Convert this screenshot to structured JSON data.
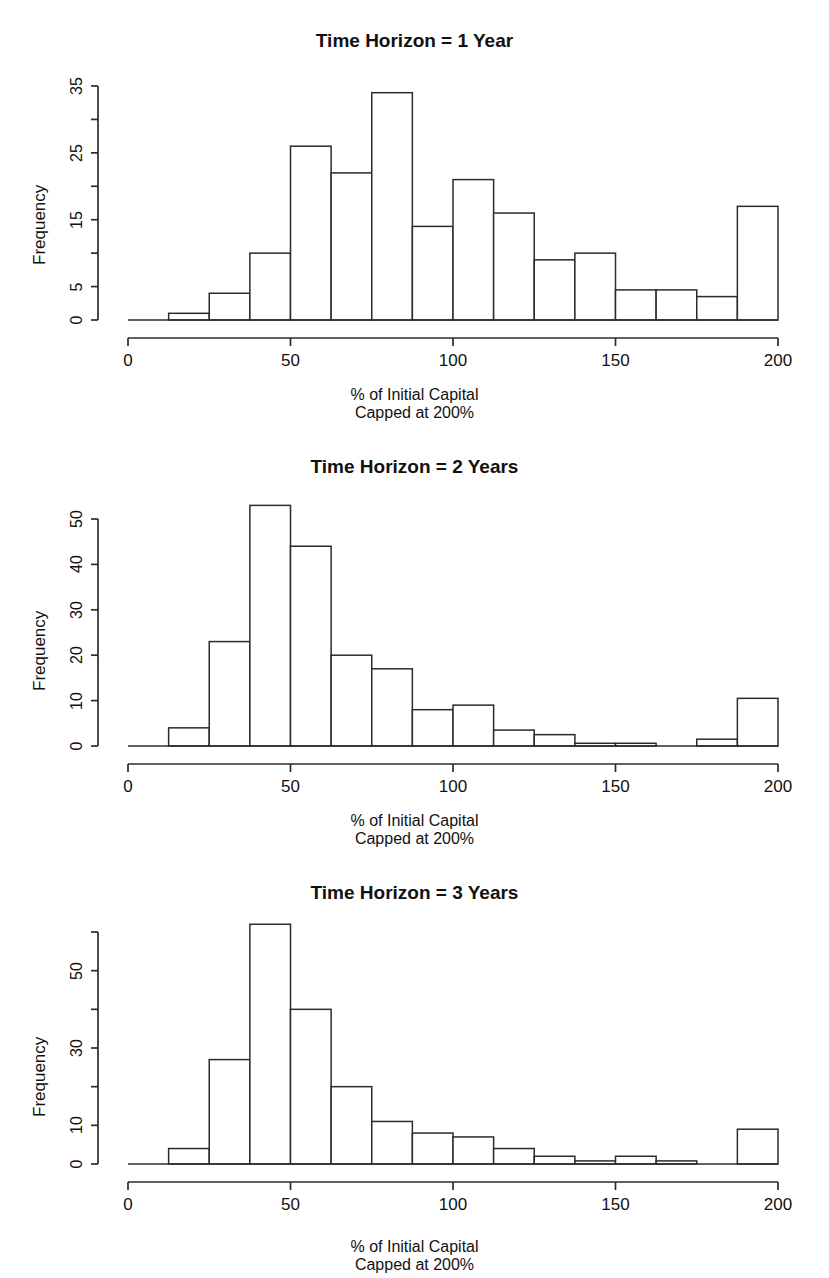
{
  "figure": {
    "background": "#ffffff",
    "axis_color": "#2b2b2b",
    "bar_fill": "#ffffff",
    "bar_stroke": "#2b2b2b",
    "panel_count": 3
  },
  "panels": [
    {
      "title": "Time Horizon = 1 Year",
      "ylabel": "Frequency",
      "xlabel_line1": "% of Initial Capital",
      "xlabel_line2": "Capped at 200%",
      "ytick_labels": [
        "0",
        "5",
        "15",
        "25",
        "35"
      ],
      "ytick_values": [
        0,
        5,
        15,
        25,
        35
      ],
      "yminor_values": [
        10,
        20,
        30
      ],
      "xtick_labels": [
        "0",
        "50",
        "100",
        "150",
        "200"
      ],
      "xtick_values": [
        0,
        50,
        100,
        150,
        200
      ]
    },
    {
      "title": "Time Horizon = 2 Years",
      "ylabel": "Frequency",
      "xlabel_line1": "% of Initial Capital",
      "xlabel_line2": "Capped at 200%",
      "ytick_labels": [
        "0",
        "10",
        "20",
        "30",
        "40",
        "50"
      ],
      "ytick_values": [
        0,
        10,
        20,
        30,
        40,
        50
      ],
      "yminor_values": [],
      "xtick_labels": [
        "0",
        "50",
        "100",
        "150",
        "200"
      ],
      "xtick_values": [
        0,
        50,
        100,
        150,
        200
      ]
    },
    {
      "title": "Time Horizon = 3 Years",
      "ylabel": "Frequency",
      "xlabel_line1": "% of Initial Capital",
      "xlabel_line2": "Capped at 200%",
      "ytick_labels": [
        "0",
        "10",
        "30",
        "50"
      ],
      "ytick_values": [
        0,
        10,
        30,
        50
      ],
      "yminor_values": [
        20,
        40,
        60
      ],
      "xtick_labels": [
        "0",
        "50",
        "100",
        "150",
        "200"
      ],
      "xtick_values": [
        0,
        50,
        100,
        150,
        200
      ]
    }
  ],
  "chart_data": [
    {
      "type": "bar",
      "title": "Time Horizon = 1 Year",
      "xlabel": "% of Initial Capital Capped at 200%",
      "ylabel": "Frequency",
      "bin_width": 12.5,
      "bin_edges": [
        0,
        12.5,
        25,
        37.5,
        50,
        62.5,
        75,
        87.5,
        100,
        112.5,
        125,
        137.5,
        150,
        162.5,
        175,
        187.5,
        200
      ],
      "categories": [
        "0-12.5",
        "12.5-25",
        "25-37.5",
        "37.5-50",
        "50-62.5",
        "62.5-75",
        "75-87.5",
        "87.5-100",
        "100-112.5",
        "112.5-125",
        "125-137.5",
        "137.5-150",
        "150-162.5",
        "162.5-175",
        "175-187.5",
        "187.5-200"
      ],
      "values": [
        0,
        1,
        4,
        10,
        26,
        22,
        34,
        14,
        21,
        16,
        9,
        10,
        4.5,
        4.5,
        3.5,
        17
      ],
      "xlim": [
        0,
        200
      ],
      "ylim": [
        0,
        35
      ],
      "grid": false,
      "legend": false
    },
    {
      "type": "bar",
      "title": "Time Horizon = 2 Years",
      "xlabel": "% of Initial Capital Capped at 200%",
      "ylabel": "Frequency",
      "bin_width": 12.5,
      "bin_edges": [
        0,
        12.5,
        25,
        37.5,
        50,
        62.5,
        75,
        87.5,
        100,
        112.5,
        125,
        137.5,
        150,
        162.5,
        175,
        187.5,
        200
      ],
      "categories": [
        "0-12.5",
        "12.5-25",
        "25-37.5",
        "37.5-50",
        "50-62.5",
        "62.5-75",
        "75-87.5",
        "87.5-100",
        "100-112.5",
        "112.5-125",
        "125-137.5",
        "137.5-150",
        "150-162.5",
        "162.5-175",
        "175-187.5",
        "187.5-200"
      ],
      "values": [
        0,
        4,
        23,
        53,
        44,
        20,
        17,
        8,
        9,
        3.5,
        2.5,
        0.6,
        0.6,
        0,
        1.5,
        10.5
      ],
      "xlim": [
        0,
        200
      ],
      "ylim": [
        0,
        53
      ],
      "grid": false,
      "legend": false
    },
    {
      "type": "bar",
      "title": "Time Horizon = 3 Years",
      "xlabel": "% of Initial Capital Capped at 200%",
      "ylabel": "Frequency",
      "bin_width": 12.5,
      "bin_edges": [
        0,
        12.5,
        25,
        37.5,
        50,
        62.5,
        75,
        87.5,
        100,
        112.5,
        125,
        137.5,
        150,
        162.5,
        175,
        187.5,
        200
      ],
      "categories": [
        "0-12.5",
        "12.5-25",
        "25-37.5",
        "37.5-50",
        "50-62.5",
        "62.5-75",
        "75-87.5",
        "87.5-100",
        "100-112.5",
        "112.5-125",
        "125-137.5",
        "137.5-150",
        "150-162.5",
        "162.5-175",
        "175-187.5",
        "187.5-200"
      ],
      "values": [
        0,
        4,
        27,
        62,
        40,
        20,
        11,
        8,
        7,
        4,
        2,
        0.8,
        2,
        0.8,
        0,
        9
      ],
      "xlim": [
        0,
        200
      ],
      "ylim": [
        0,
        62
      ],
      "grid": false,
      "legend": false
    }
  ]
}
